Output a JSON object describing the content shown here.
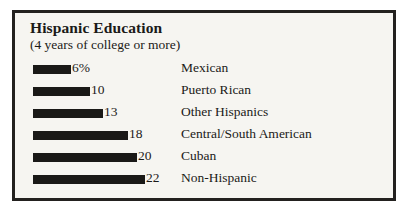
{
  "chart_data": {
    "type": "bar",
    "title": "Hispanic Education",
    "subtitle": "(4 years of college or more)",
    "orientation": "horizontal",
    "xlabel": "",
    "ylabel": "",
    "unit": "percent",
    "xlim": [
      0,
      22
    ],
    "grid": false,
    "legend": null,
    "categories": [
      "Mexican",
      "Puerto Rican",
      "Other Hispanics",
      "Central/South American",
      "Cuban",
      "Non-Hispanic"
    ],
    "values": [
      6,
      10,
      13,
      18,
      20,
      22
    ],
    "value_labels": [
      "6%",
      "10",
      "13",
      "18",
      "20",
      "22"
    ],
    "bar_color": "#1a1917",
    "background_color": "#f6f5f1",
    "border_color": "#23211f",
    "text_color": "#1b1a18",
    "rows": [
      {
        "label": "Mexican",
        "value": 6,
        "value_label": "6%",
        "bar_px": 38
      },
      {
        "label": "Puerto Rican",
        "value": 10,
        "value_label": "10",
        "bar_px": 57
      },
      {
        "label": "Other Hispanics",
        "value": 13,
        "value_label": "13",
        "bar_px": 70
      },
      {
        "label": "Central/South American",
        "value": 18,
        "value_label": "18",
        "bar_px": 95
      },
      {
        "label": "Cuban",
        "value": 20,
        "value_label": "20",
        "bar_px": 104
      },
      {
        "label": "Non-Hispanic",
        "value": 22,
        "value_label": "22",
        "bar_px": 112
      }
    ]
  }
}
